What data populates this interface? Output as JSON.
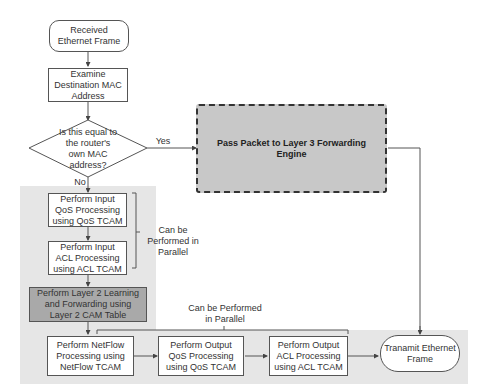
{
  "flowchart": {
    "start": "Received Ethernet Frame",
    "examine": "Examine Destination MAC Address",
    "decision": "Is this equal to the router's own MAC address?",
    "yes_label": "Yes",
    "no_label": "No",
    "layer3": "Pass Packet to Layer 3 Forwarding Engine",
    "input_qos": "Perform Input QoS Processing using QoS TCAM",
    "input_acl": "Perform Input ACL Processing using ACL TCAM",
    "parallel_note_1": "Can be Performed in Parallel",
    "layer2": "Perform Layer 2 Learning and Forwarding using Layer 2 CAM Table",
    "parallel_note_2": "Can be Performed in Parallel",
    "netflow": "Perform NetFlow Processing using NetFlow TCAM",
    "output_qos": "Perform Output QoS  Processing using QoS TCAM",
    "output_acl": "Perform Output ACL Processing using ACL TCAM",
    "transmit": "Tranamit Ethernet Frame"
  }
}
